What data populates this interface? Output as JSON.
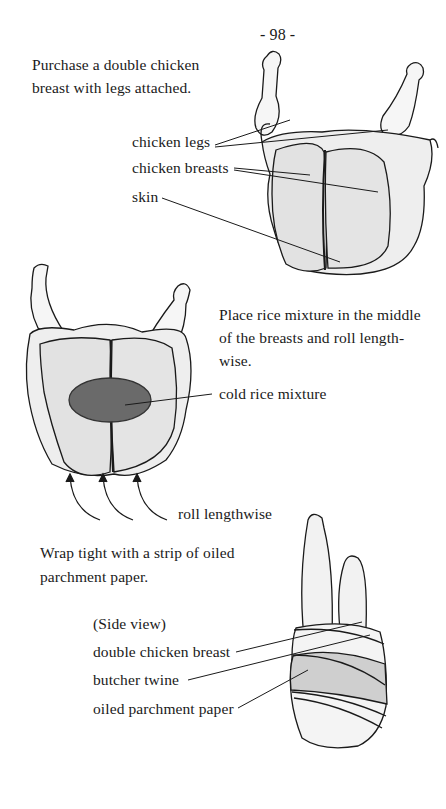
{
  "page_number": "- 98 -",
  "step1": {
    "instruction": [
      "Purchase a double chicken",
      "breast with legs attached."
    ],
    "labels": {
      "legs": "chicken legs",
      "breasts": "chicken breasts",
      "skin": "skin"
    }
  },
  "step2": {
    "instruction": [
      "Place rice mixture in the middle",
      "of the breasts and roll length-",
      "wise."
    ],
    "labels": {
      "rice": "cold rice mixture",
      "roll": "roll lengthwise"
    }
  },
  "step3": {
    "instruction": [
      "Wrap tight with a strip of oiled",
      "parchment paper."
    ],
    "labels": {
      "view": "(Side view)",
      "breast": "double chicken breast",
      "twine": "butcher twine",
      "paper": "oiled parchment paper"
    }
  },
  "colors": {
    "ink": "#1a1a1a",
    "shade": "#d8d8d8",
    "rice": "#6a6a6a"
  }
}
